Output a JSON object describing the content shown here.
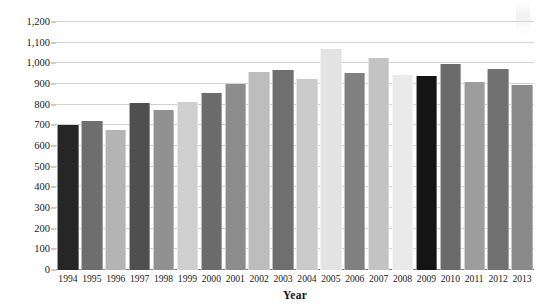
{
  "chart_data": {
    "type": "bar",
    "title": "",
    "subtitle": "",
    "xlabel": "Year",
    "ylabel": "",
    "grid": true,
    "legend": false,
    "legend_position": "none",
    "ylim": [
      0,
      1200
    ],
    "ytick_step": 100,
    "categories": [
      "1994",
      "1995",
      "1996",
      "1997",
      "1998",
      "1999",
      "2000",
      "2001",
      "2002",
      "2003",
      "2004",
      "2005",
      "2006",
      "2007",
      "2008",
      "2009",
      "2010",
      "2011",
      "2012",
      "2013"
    ],
    "values": [
      700,
      722,
      678,
      810,
      775,
      815,
      855,
      898,
      960,
      970,
      922,
      1070,
      955,
      1025,
      945,
      938,
      995,
      912,
      972,
      895
    ],
    "ytick_labels": [
      "0",
      "100",
      "200",
      "300",
      "400",
      "500",
      "600",
      "700",
      "800",
      "900",
      "1,000",
      "1,100",
      "1,200"
    ],
    "ytick_values": [
      0,
      100,
      200,
      300,
      400,
      500,
      600,
      700,
      800,
      900,
      1000,
      1100,
      1200
    ],
    "bar_colors": [
      "#262626",
      "#6e6e6e",
      "#b4b4b4",
      "#4f4f4f",
      "#919191",
      "#cfcfcf",
      "#6b6b6b",
      "#8d8d8d",
      "#bdbdbd",
      "#6f6f6f",
      "#cacaca",
      "#e3e3e3",
      "#808080",
      "#c3c3c3",
      "#eaeaea",
      "#141414",
      "#6b6b6b",
      "#9d9d9d",
      "#717171",
      "#8a8a8a"
    ],
    "axis_color": "#7d7d7d",
    "grid_color": "#d2d2d2"
  }
}
